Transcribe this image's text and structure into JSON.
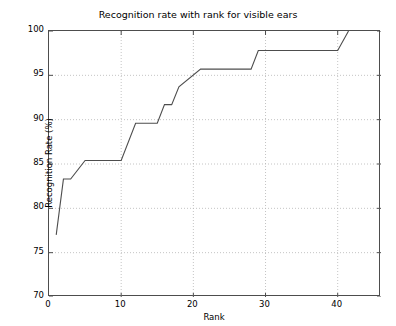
{
  "chart_data": {
    "type": "line",
    "title": "Recognition rate with rank for visible ears",
    "xlabel": "Rank",
    "ylabel": "Recognition Rate (%)",
    "xlim": [
      0,
      46
    ],
    "ylim": [
      70,
      100
    ],
    "xticks": [
      0,
      10,
      20,
      30,
      40
    ],
    "yticks": [
      70,
      75,
      80,
      85,
      90,
      95,
      100
    ],
    "xtick_labels": [
      "0",
      "10",
      "20",
      "30",
      "40"
    ],
    "ytick_labels": [
      "70",
      "75",
      "80",
      "85",
      "90",
      "95",
      "100"
    ],
    "grid": true,
    "grid_style": "dotted",
    "legend": null,
    "line_color": "#4d4d4d",
    "line_width": 1.1,
    "series": [
      {
        "name": "Recognition rate",
        "x": [
          1,
          2,
          3,
          5,
          10,
          12,
          15,
          16,
          17,
          18,
          21,
          28,
          29,
          40,
          41.5
        ],
        "y": [
          77.0,
          83.3,
          83.3,
          85.4,
          85.4,
          89.6,
          89.6,
          91.7,
          91.7,
          93.7,
          95.7,
          95.7,
          97.8,
          97.8,
          100.0
        ]
      }
    ]
  },
  "axes": {
    "title": "Recognition rate with rank for visible ears",
    "x_axis_label": "Rank",
    "y_axis_label": "Recognition Rate (%)"
  },
  "colors": {
    "background": "#ffffff",
    "axis": "#4d4d4d",
    "grid": "#b5b5b5",
    "line": "#4d4d4d",
    "text": "#000000"
  }
}
